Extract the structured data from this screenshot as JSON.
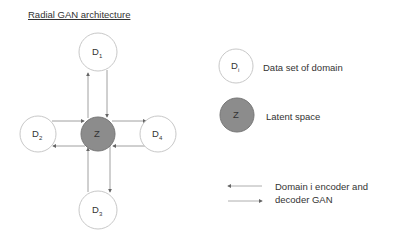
{
  "title": "Radial GAN architecture",
  "nodes": {
    "d1": {
      "label": "D",
      "sub": "1"
    },
    "d2": {
      "label": "D",
      "sub": "2"
    },
    "d3": {
      "label": "D",
      "sub": "3"
    },
    "d4": {
      "label": "D",
      "sub": "4"
    },
    "z": {
      "label": "Z"
    }
  },
  "legend": {
    "domain": {
      "label": "D",
      "sub": "i",
      "text": "Data set of domain"
    },
    "latent": {
      "label": "Z",
      "text": "Latent space"
    },
    "arrows": {
      "line1": "Domain i encoder and",
      "line2": "decoder GAN"
    }
  },
  "colors": {
    "latent_fill": "#8c8c8c",
    "latent_stroke": "#777777",
    "domain_stroke": "#c8c8c8",
    "line": "#888888"
  }
}
